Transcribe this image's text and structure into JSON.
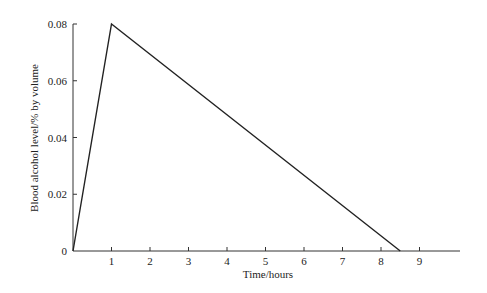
{
  "chart_data": {
    "type": "line",
    "title": "",
    "xlabel": "Time/hours",
    "ylabel": "Blood alcohol level/% by volume",
    "xlim": [
      0,
      10
    ],
    "ylim": [
      0,
      0.08
    ],
    "x_ticks": [
      1,
      2,
      3,
      4,
      5,
      6,
      7,
      8,
      9
    ],
    "y_ticks": [
      0,
      0.02,
      0.04,
      0.06,
      0.08
    ],
    "y_tick_labels": [
      "0",
      "0.02",
      "0.04",
      "0.06",
      "0.08"
    ],
    "grid": false,
    "legend": null,
    "series": [
      {
        "name": "Blood alcohol level",
        "x": [
          0,
          1,
          8.5
        ],
        "y": [
          0,
          0.08,
          0
        ]
      }
    ],
    "color": "#222222"
  }
}
